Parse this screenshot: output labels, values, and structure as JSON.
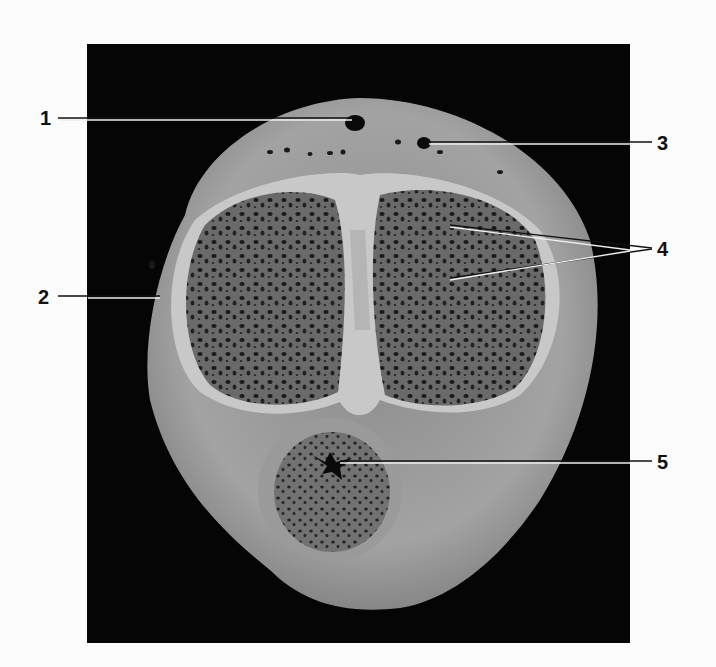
{
  "figure": {
    "background_color": "#050505",
    "page_color": "#fcfcfc",
    "labels": [
      {
        "id": "1",
        "text": "1",
        "x": 40,
        "y": 108,
        "targets": [
          [
            355,
            120
          ]
        ],
        "line_end_x": 58,
        "line_y": 118
      },
      {
        "id": "2",
        "text": "2",
        "x": 38,
        "y": 287,
        "targets": [
          [
            160,
            297
          ]
        ],
        "line_end_x": 58,
        "line_y": 297
      },
      {
        "id": "3",
        "text": "3",
        "x": 660,
        "y": 133,
        "targets": [
          [
            429,
            143
          ]
        ],
        "line_end_x": 652,
        "line_y": 143
      },
      {
        "id": "4",
        "text": "4",
        "x": 660,
        "y": 239,
        "targets": [
          [
            450,
            226
          ],
          [
            450,
            279
          ]
        ],
        "line_end_x": 652,
        "line_y": 249
      },
      {
        "id": "5",
        "text": "5",
        "x": 660,
        "y": 455,
        "targets": [
          [
            340,
            462
          ]
        ],
        "line_end_x": 652,
        "line_y": 462
      }
    ]
  }
}
